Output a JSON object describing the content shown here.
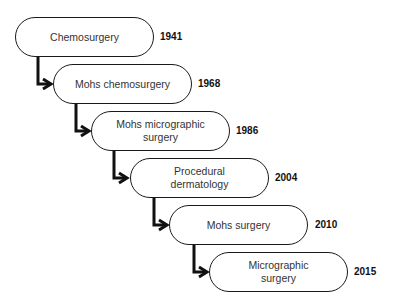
{
  "diagram": {
    "type": "timeline-staircase",
    "nodes": [
      {
        "label": "Chemosurgery",
        "year": "1941"
      },
      {
        "label": "Mohs chemosurgery",
        "year": "1968"
      },
      {
        "label": "Mohs micrographic\nsurgery",
        "year": "1986"
      },
      {
        "label": "Procedural\ndermatology",
        "year": "2004"
      },
      {
        "label": "Mohs surgery",
        "year": "2010"
      },
      {
        "label": "Micrographic\nsurgery",
        "year": "2015"
      }
    ],
    "edges": [
      {
        "from": 0,
        "to": 1
      },
      {
        "from": 1,
        "to": 2
      },
      {
        "from": 2,
        "to": 3
      },
      {
        "from": 3,
        "to": 4
      },
      {
        "from": 4,
        "to": 5
      }
    ],
    "colors": {
      "stroke": "#1a1a1a",
      "text": "#333333",
      "year": "#111111",
      "background": "#ffffff"
    }
  }
}
